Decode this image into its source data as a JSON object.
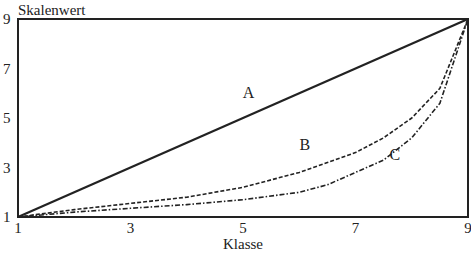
{
  "chart_data": {
    "type": "line",
    "title": "",
    "xlabel": "Klasse",
    "ylabel": "Skalenwert",
    "xlim": [
      1,
      9
    ],
    "ylim": [
      1,
      9
    ],
    "x_ticks": [
      "1",
      "3",
      "5",
      "7",
      "9"
    ],
    "y_ticks": [
      "1",
      "3",
      "5",
      "7",
      "9"
    ],
    "grid": false,
    "legend": "inline labels",
    "series": [
      {
        "name": "A",
        "style": "solid",
        "x": [
          1,
          9
        ],
        "y": [
          1,
          9
        ]
      },
      {
        "name": "B",
        "style": "dashed",
        "x": [
          1,
          2,
          3,
          4,
          5,
          6,
          6.5,
          7,
          7.5,
          8,
          8.5,
          9
        ],
        "y": [
          1,
          1.3,
          1.55,
          1.8,
          2.2,
          2.8,
          3.2,
          3.6,
          4.2,
          5.0,
          6.2,
          9
        ]
      },
      {
        "name": "C",
        "style": "dash-dot",
        "x": [
          1,
          2,
          3,
          4,
          5,
          6,
          6.5,
          7,
          7.5,
          8,
          8.5,
          9
        ],
        "y": [
          1,
          1.2,
          1.35,
          1.5,
          1.7,
          2.0,
          2.3,
          2.8,
          3.3,
          4.2,
          5.6,
          9
        ]
      }
    ],
    "annotations": [
      {
        "text": "A",
        "x": 5.1,
        "y": 5.8
      },
      {
        "text": "B",
        "x": 6.1,
        "y": 3.7
      },
      {
        "text": "C",
        "x": 7.7,
        "y": 3.3
      }
    ]
  }
}
